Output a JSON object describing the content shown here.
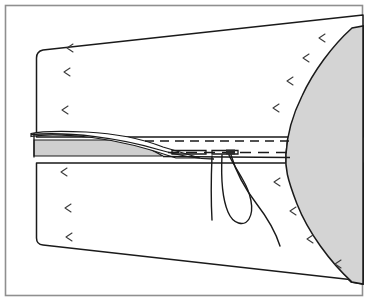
{
  "figure": {
    "caption": "",
    "canvas": {
      "width": 368,
      "height": 301
    },
    "background_color": "#ffffff"
  },
  "colors": {
    "outline": "#1a1a1a",
    "frame": "#8f8f8f",
    "fabric_fill": "#ffffff",
    "shadow_fill": "#d4d4d4",
    "seam_fill": "#cfcfcf",
    "grain_mark": "#3a3a3a"
  },
  "frame": {
    "label": "figure-border",
    "x": 5,
    "y": 5,
    "width": 358,
    "height": 291
  },
  "parts": [
    {
      "id": "fabric-panel",
      "label": "Fabric panel",
      "fill": "#ffffff"
    },
    {
      "id": "shadow-region",
      "label": "Shaded background region",
      "fill": "#d4d4d4"
    },
    {
      "id": "seam-allowance",
      "label": "Seam allowance wedge",
      "fill": "#cfcfcf"
    },
    {
      "id": "folded-flap",
      "label": "Folded edge flap",
      "fill": "#ffffff"
    },
    {
      "id": "stitch-line-upper",
      "label": "Upper dashed stitch line"
    },
    {
      "id": "stitch-line-lower",
      "label": "Lower dashed stitch line"
    },
    {
      "id": "needle-thread-loop",
      "label": "Needle thread loop"
    },
    {
      "id": "thread-tail",
      "label": "Thread tail"
    }
  ],
  "grain_marks": {
    "label": "Grain direction marks",
    "glyph": "chevron-left",
    "positions": [
      {
        "x": 70,
        "y": 48,
        "r": -12
      },
      {
        "x": 67,
        "y": 72,
        "r": -8
      },
      {
        "x": 65,
        "y": 110,
        "r": -6
      },
      {
        "x": 64,
        "y": 172,
        "r": -6
      },
      {
        "x": 68,
        "y": 208,
        "r": -5
      },
      {
        "x": 69,
        "y": 237,
        "r": -4
      },
      {
        "x": 322,
        "y": 38,
        "r": -10
      },
      {
        "x": 306,
        "y": 58,
        "r": -10
      },
      {
        "x": 290,
        "y": 81,
        "r": -9
      },
      {
        "x": 276,
        "y": 108,
        "r": -8
      },
      {
        "x": 277,
        "y": 182,
        "r": -7
      },
      {
        "x": 293,
        "y": 211,
        "r": -6
      },
      {
        "x": 310,
        "y": 239,
        "r": -6
      },
      {
        "x": 338,
        "y": 264,
        "r": -6
      }
    ]
  }
}
